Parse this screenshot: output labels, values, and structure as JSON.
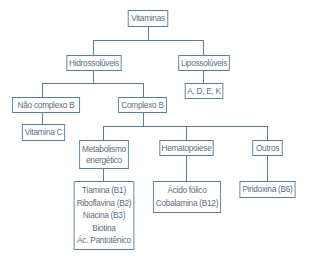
{
  "diagram": {
    "type": "tree",
    "root": "Vitaminas",
    "nodes": {
      "vitaminas": "Vitaminas",
      "hidrossoluveis": "Hidrossolúveis",
      "lipossoluveis": "Lipossolúveis",
      "adek": "A, D, E, K",
      "nao_complexo_b": "Não complexo B",
      "complexo_b": "Complexo B",
      "vitamina_c": "Vitamina C",
      "metabolismo": [
        "Metabolismo",
        "energético"
      ],
      "hematopoiese": "Hematopoiese",
      "outros": "Outros",
      "metabolismo_list": [
        "Tiamina (B1)",
        "Riboflavina (B2)",
        "Niacina (B3)",
        "Biotina",
        "Ác. Pantotênico"
      ],
      "hematopoiese_list": [
        "Ácido fólico",
        "Cobalamina (B12)"
      ],
      "outros_list": [
        "Piridoxina (B6)"
      ]
    },
    "edges": [
      [
        "Vitaminas",
        "Hidrossolúveis"
      ],
      [
        "Vitaminas",
        "Lipossolúveis"
      ],
      [
        "Lipossolúveis",
        "A, D, E, K"
      ],
      [
        "Hidrossolúveis",
        "Não complexo B"
      ],
      [
        "Hidrossolúveis",
        "Complexo B"
      ],
      [
        "Não complexo B",
        "Vitamina C"
      ],
      [
        "Complexo B",
        "Metabolismo energético"
      ],
      [
        "Complexo B",
        "Hematopoiese"
      ],
      [
        "Complexo B",
        "Outros"
      ],
      [
        "Metabolismo energético",
        "Tiamina (B1) ... Ác. Pantotênico"
      ],
      [
        "Hematopoiese",
        "Ácido fólico / Cobalamina (B12)"
      ],
      [
        "Outros",
        "Piridoxina (B6)"
      ]
    ],
    "colors": {
      "border": "#5a7d99",
      "text": "#5d6f80",
      "background": "#ffffff"
    }
  }
}
